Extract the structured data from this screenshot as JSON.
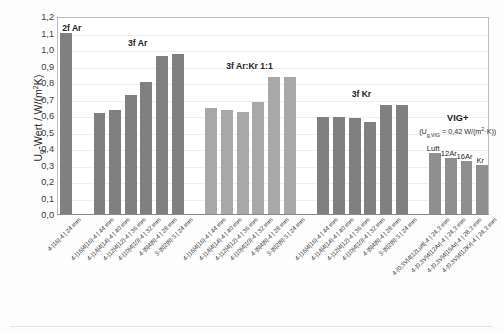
{
  "chart_data": {
    "type": "bar",
    "title": "",
    "xlabel": "",
    "ylabel": "Ug-Wert / W/(m²K)",
    "ylim": [
      0,
      1.2
    ],
    "grid": true,
    "legend": "none",
    "ytick_labels": [
      "1,2",
      "1,1",
      "1,0",
      "0,9",
      "0,8",
      "0,7",
      "0,6",
      "0,5",
      "0,4",
      "0,3",
      "0,2",
      "0,1",
      "0,0"
    ],
    "ytick_values": [
      1.2,
      1.1,
      1.0,
      0.9,
      0.8,
      0.7,
      0.6,
      0.5,
      0.4,
      0.3,
      0.2,
      0.1,
      0.0
    ],
    "groups": [
      {
        "name": "2f Ar",
        "color": "#808080",
        "bars": [
          {
            "label": "4-|16|-4 | 24 mm",
            "value": 1.1
          }
        ]
      },
      {
        "name": "3f Ar",
        "color": "#808080",
        "bars": [
          {
            "label": "4-|16|4|16|-4 | 44 mm",
            "value": 0.61
          },
          {
            "label": "4-|14|4|14|-4 | 40 mm",
            "value": 0.63
          },
          {
            "label": "4-|12|4|12|-4 | 36 mm",
            "value": 0.72
          },
          {
            "label": "4-|10|4|10|-4 | 32 mm",
            "value": 0.8
          },
          {
            "label": "4-|8|4|8|-4 | 28 mm",
            "value": 0.96
          },
          {
            "label": "3-|8|2|8|-3 | 24 mm",
            "value": 0.97
          }
        ]
      },
      {
        "name": "3f Ar:Kr 1:1",
        "color": "#a8a8a8",
        "bars": [
          {
            "label": "4-|16|4|16|-4 | 44 mm",
            "value": 0.64
          },
          {
            "label": "4-|14|4|14|-4 | 40 mm",
            "value": 0.63
          },
          {
            "label": "4-|12|4|12|-4 | 36 mm",
            "value": 0.62
          },
          {
            "label": "4-|10|4|10|-4 | 32 mm",
            "value": 0.68
          },
          {
            "label": "4-|8|4|8|-4 | 28 mm",
            "value": 0.83
          },
          {
            "label": "3-|8|2|8|-3 | 24 mm",
            "value": 0.83
          }
        ]
      },
      {
        "name": "3f Kr",
        "color": "#808080",
        "bars": [
          {
            "label": "4-|16|4|16|-4 | 44 mm",
            "value": 0.59
          },
          {
            "label": "4-|14|4|14|-4 | 40 mm",
            "value": 0.59
          },
          {
            "label": "4-|12|4|12|-4 | 36 mm",
            "value": 0.58
          },
          {
            "label": "4-|10|4|10|-4 | 32 mm",
            "value": 0.56
          },
          {
            "label": "4-|8|4|8|-4 | 28 mm",
            "value": 0.66
          },
          {
            "label": "3-|8|2|8|-3 | 24 mm",
            "value": 0.66
          }
        ]
      },
      {
        "name": "VIG+",
        "color": "#8f8f8f",
        "annotation": "(Ug,VIG = 0,42 W/(m²·K))",
        "bars": [
          {
            "label": "4-|0,3V|4|12Luft|-4 | 24,3 mm",
            "value": 0.37,
            "tag": "Luft"
          },
          {
            "label": "4-|0,3V|4|12Ar|-4 | 24,3 mm",
            "value": 0.34,
            "tag": "12Ar"
          },
          {
            "label": "4-|0,3V|4|16Ar|-4 | 28,3 mm",
            "value": 0.32,
            "tag": "16Ar"
          },
          {
            "label": "4-|0,3V|4|12Kr|-4 | 24,3 mm",
            "value": 0.3,
            "tag": "Kr"
          }
        ]
      }
    ]
  }
}
